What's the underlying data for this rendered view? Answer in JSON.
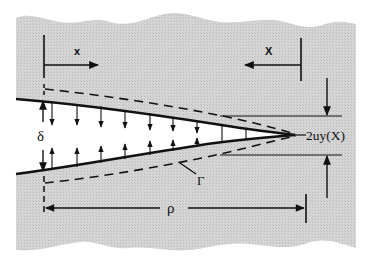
{
  "figure": {
    "background": "#ffffff",
    "material_fill": "#cfcfcf",
    "crack_fill": "#ffffff",
    "line_color": "#111111"
  },
  "labels": {
    "x_left": "x",
    "x_right": "X",
    "delta": "δ",
    "gamma": "Γ",
    "rho": "ρ",
    "opening": "2uy(X)"
  },
  "elements": {
    "left_axis": {
      "description": "Coordinate x measured from crack mouth, arrow pointing right"
    },
    "right_axis": {
      "description": "Coordinate X measured from crack tip, arrow pointing left"
    },
    "crack_faces": {
      "description": "Upper and lower crack surfaces converging to tip"
    },
    "dashed_contour": {
      "description": "Dashed contour Γ surrounding the crack"
    },
    "traction_arrows": {
      "count": 8,
      "description": "Paired vertical arrows between crack faces"
    },
    "opening_dimension": {
      "description": "Vertical dimension arrows marking opening 2uy(X)"
    },
    "length_dimension": {
      "description": "Horizontal dimension ρ from crack mouth to tip"
    }
  }
}
